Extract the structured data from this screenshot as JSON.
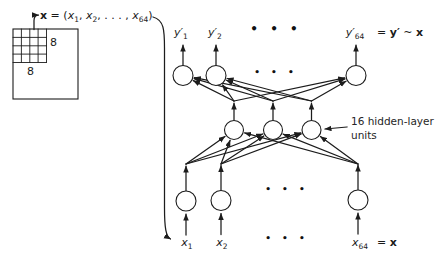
{
  "colors": {
    "ink": "#1c1c1c",
    "paper": "#ffffff"
  },
  "patch_panel": {
    "size_right": "8",
    "size_bottom": "8",
    "label": {
      "vec": "x",
      "eq_open": " = (",
      "x1b": "x",
      "x1s": "1",
      "comma": ", ",
      "x2b": "x",
      "x2s": "2",
      "dots": ", . . . , ",
      "x64b": "x",
      "x64s": "64",
      "close": ")"
    }
  },
  "network": {
    "output_labels": [
      {
        "base": "y′",
        "sub": "1"
      },
      {
        "base": "y′",
        "sub": "2"
      },
      {
        "base": "y′",
        "sub": "64"
      }
    ],
    "output_equation": {
      "pre": "= ",
      "y": "y′",
      "tilde": " ~ ",
      "x": "x"
    },
    "hidden_annotation": {
      "line1": "16 hidden-layer",
      "line2": "units"
    },
    "input_labels": [
      {
        "base": "x",
        "sub": "1"
      },
      {
        "base": "x",
        "sub": "2"
      },
      {
        "base": "x",
        "sub": "64"
      }
    ],
    "input_equation": {
      "pre": "= ",
      "x": "x"
    },
    "ellipsis": "• • •"
  }
}
